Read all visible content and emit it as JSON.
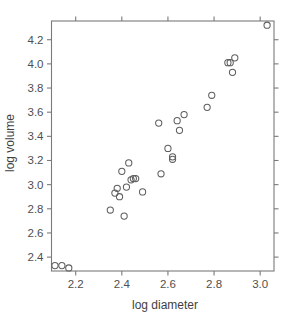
{
  "chart_data": {
    "type": "scatter",
    "title": "",
    "subtitle": "",
    "xlabel": "log diameter",
    "ylabel": "log volume",
    "xlim": [
      2.095,
      3.06
    ],
    "ylim": [
      2.285,
      4.355
    ],
    "xticks": [
      2.2,
      2.4,
      2.6,
      2.8,
      3.0
    ],
    "xtick_labels": [
      "2.2",
      "2.4",
      "2.6",
      "2.8",
      "3.0"
    ],
    "yticks": [
      2.4,
      2.6,
      2.8,
      3.0,
      3.2,
      3.4,
      3.6,
      3.8,
      4.0,
      4.2
    ],
    "ytick_labels": [
      "2.4",
      "2.6",
      "2.8",
      "3.0",
      "3.2",
      "3.4",
      "3.6",
      "3.8",
      "4.0",
      "4.2"
    ],
    "grid": false,
    "legend": null,
    "legend_position": "none",
    "marker": "open-circle",
    "marker_size": 3.1,
    "marker_color": "#5e5e5e",
    "frame": "box",
    "ticks_all_sides": true,
    "n_points": 30,
    "x": [
      2.11,
      2.14,
      2.17,
      2.35,
      2.37,
      2.38,
      2.39,
      2.4,
      2.41,
      2.42,
      2.43,
      2.44,
      2.45,
      2.46,
      2.49,
      2.56,
      2.57,
      2.6,
      2.62,
      2.62,
      2.64,
      2.65,
      2.67,
      2.77,
      2.79,
      2.86,
      2.87,
      2.88,
      2.89,
      3.03
    ],
    "y": [
      2.33,
      2.33,
      2.31,
      2.79,
      2.93,
      2.97,
      2.9,
      3.11,
      2.74,
      2.98,
      3.18,
      3.04,
      3.05,
      3.05,
      2.94,
      3.51,
      3.09,
      3.3,
      3.23,
      3.21,
      3.53,
      3.45,
      3.58,
      3.64,
      3.74,
      4.01,
      4.01,
      3.93,
      4.05,
      4.32
    ],
    "points": [
      {
        "x": 2.11,
        "y": 2.33
      },
      {
        "x": 2.14,
        "y": 2.33
      },
      {
        "x": 2.17,
        "y": 2.31
      },
      {
        "x": 2.35,
        "y": 2.79
      },
      {
        "x": 2.37,
        "y": 2.93
      },
      {
        "x": 2.38,
        "y": 2.97
      },
      {
        "x": 2.39,
        "y": 2.9
      },
      {
        "x": 2.4,
        "y": 3.11
      },
      {
        "x": 2.41,
        "y": 2.74
      },
      {
        "x": 2.42,
        "y": 2.98
      },
      {
        "x": 2.43,
        "y": 3.18
      },
      {
        "x": 2.44,
        "y": 3.04
      },
      {
        "x": 2.45,
        "y": 3.05
      },
      {
        "x": 2.46,
        "y": 3.05
      },
      {
        "x": 2.49,
        "y": 2.94
      },
      {
        "x": 2.56,
        "y": 3.51
      },
      {
        "x": 2.57,
        "y": 3.09
      },
      {
        "x": 2.6,
        "y": 3.3
      },
      {
        "x": 2.62,
        "y": 3.23
      },
      {
        "x": 2.62,
        "y": 3.21
      },
      {
        "x": 2.64,
        "y": 3.53
      },
      {
        "x": 2.65,
        "y": 3.45
      },
      {
        "x": 2.67,
        "y": 3.58
      },
      {
        "x": 2.77,
        "y": 3.64
      },
      {
        "x": 2.79,
        "y": 3.74
      },
      {
        "x": 2.86,
        "y": 4.01
      },
      {
        "x": 2.87,
        "y": 4.01
      },
      {
        "x": 2.88,
        "y": 3.93
      },
      {
        "x": 2.89,
        "y": 4.05
      },
      {
        "x": 3.03,
        "y": 4.32
      }
    ]
  }
}
